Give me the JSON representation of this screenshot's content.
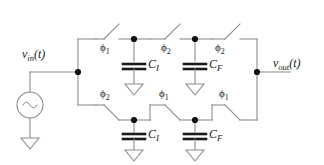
{
  "figure": {
    "background_color": "#ffffff",
    "wire_color": "#8c8c8c",
    "text_color": "#1a1a1a",
    "node_color": "#111111"
  },
  "source": {
    "type": "ac-voltage-source",
    "symbol": "sine",
    "label_prefix": "v",
    "label_subscript": "in",
    "label_suffix": "(t)",
    "label_full": "vin(t)"
  },
  "output": {
    "label_prefix": "v",
    "label_subscript": "out",
    "label_suffix": "(t)",
    "label_full": "vout(t)"
  },
  "phases": {
    "phi": "ϕ",
    "one": "1",
    "two": "2"
  },
  "branches": [
    {
      "id": "top",
      "switches": [
        {
          "id": "top-left",
          "phase_symbol": "ϕ",
          "phase_index": "1"
        },
        {
          "id": "top-middle",
          "phase_symbol": "ϕ",
          "phase_index": "2"
        },
        {
          "id": "top-right",
          "phase_symbol": "ϕ",
          "phase_index": "2"
        }
      ],
      "capacitors": [
        {
          "id": "top-ci",
          "name_prefix": "C",
          "name_subscript": "I",
          "name_full": "CI"
        },
        {
          "id": "top-cf",
          "name_prefix": "C",
          "name_subscript": "F",
          "name_full": "CF"
        }
      ]
    },
    {
      "id": "bottom",
      "switches": [
        {
          "id": "bottom-left",
          "phase_symbol": "ϕ",
          "phase_index": "2"
        },
        {
          "id": "bottom-middle",
          "phase_symbol": "ϕ",
          "phase_index": "1"
        },
        {
          "id": "bottom-right",
          "phase_symbol": "ϕ",
          "phase_index": "1"
        }
      ],
      "capacitors": [
        {
          "id": "bottom-ci",
          "name_prefix": "C",
          "name_subscript": "I",
          "name_full": "CI"
        },
        {
          "id": "bottom-cf",
          "name_prefix": "C",
          "name_subscript": "F",
          "name_full": "CF"
        }
      ]
    }
  ],
  "grounds": [
    {
      "id": "source-ground"
    },
    {
      "id": "top-ci-ground"
    },
    {
      "id": "top-cf-ground"
    },
    {
      "id": "bottom-ci-ground"
    },
    {
      "id": "bottom-cf-ground"
    }
  ]
}
